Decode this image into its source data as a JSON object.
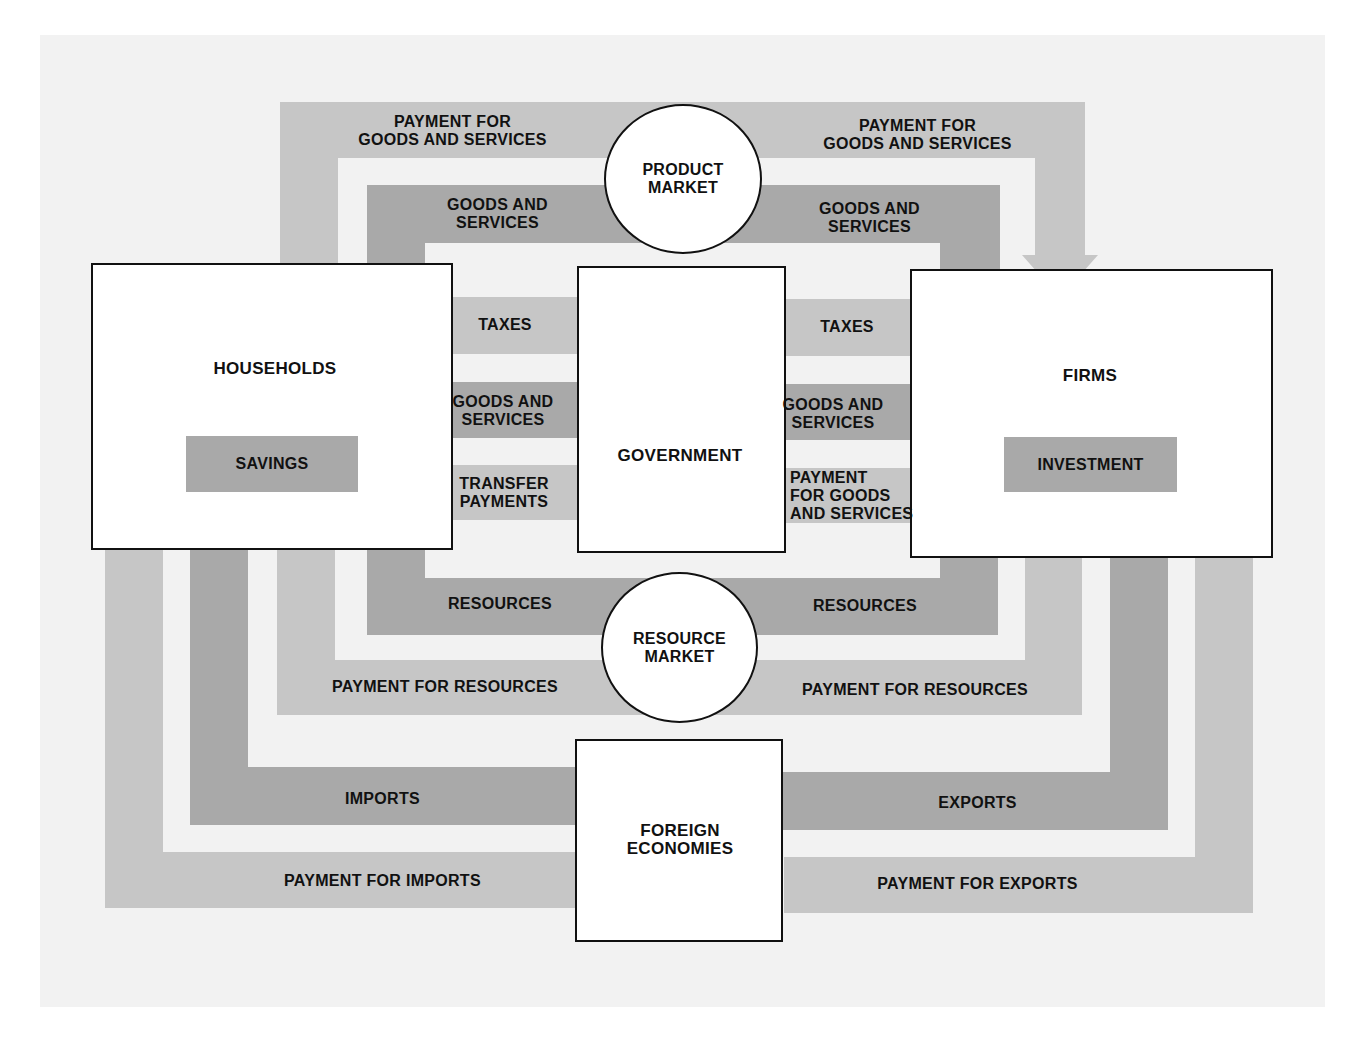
{
  "colors": {
    "real_flow": "#a9a9a9",
    "money_flow": "#c6c6c6",
    "background": "#f2f2f2",
    "box_fill": "#ffffff",
    "border": "#111111"
  },
  "sectors": {
    "households": "HOUSEHOLDS",
    "households_inner": "SAVINGS",
    "firms": "FIRMS",
    "firms_inner": "INVESTMENT",
    "government": "GOVERNMENT",
    "foreign": "FOREIGN\nECONOMIES"
  },
  "markets": {
    "product": "PRODUCT\nMARKET",
    "resource": "RESOURCE\nMARKET"
  },
  "flows": {
    "top_left_payment": "PAYMENT FOR\nGOODS AND SERVICES",
    "top_right_payment": "PAYMENT FOR\nGOODS AND SERVICES",
    "top_left_goods": "GOODS AND\nSERVICES",
    "top_right_goods": "GOODS AND\nSERVICES",
    "hh_taxes": "TAXES",
    "hh_gov_goods": "GOODS AND\nSERVICES",
    "hh_transfers": "TRANSFER\nPAYMENTS",
    "firm_taxes": "TAXES",
    "firm_gov_goods": "GOODS AND\nSERVICES",
    "gov_payment_firms": "PAYMENT\nFOR GOODS\nAND SERVICES",
    "bottom_left_resources": "RESOURCES",
    "bottom_right_resources": "RESOURCES",
    "bottom_left_payment": "PAYMENT FOR RESOURCES",
    "bottom_right_payment": "PAYMENT FOR RESOURCES",
    "imports": "IMPORTS",
    "payment_imports": "PAYMENT FOR IMPORTS",
    "exports": "EXPORTS",
    "payment_exports": "PAYMENT FOR EXPORTS"
  }
}
